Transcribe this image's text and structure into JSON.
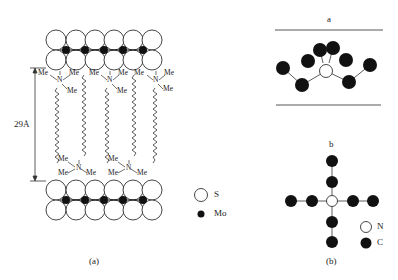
{
  "panel_a": {
    "caption": "(a)",
    "distance_label": "29Å",
    "group_label": "Me",
    "nitrogen_label": "N",
    "legend": [
      {
        "symbol": "open-circle",
        "label": "S"
      },
      {
        "symbol": "filled-circle",
        "label": "Mo"
      }
    ]
  },
  "panel_b": {
    "caption": "(b)",
    "view_a_label": "a",
    "view_b_label": "b",
    "legend": [
      {
        "symbol": "open-circle",
        "label": "N"
      },
      {
        "symbol": "filled-circle",
        "label": "C"
      }
    ]
  },
  "colors": {
    "line": "#333333",
    "fill": "#111111",
    "background": "#ffffff"
  }
}
